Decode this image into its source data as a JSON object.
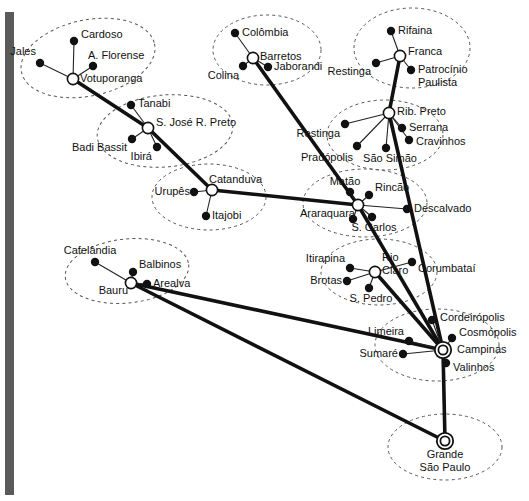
{
  "diagram": {
    "type": "hub-and-spoke network map",
    "colors": {
      "trunk": "#111111",
      "spoke": "#222222",
      "node_fill": "#ffffff",
      "terminal_fill": "#111111",
      "ellipse": "#555555",
      "label": "#111111",
      "scan_artifact": "#5a5a5a"
    },
    "scan_artifact": {
      "x": 5,
      "y": 12,
      "width": 9,
      "height": 483
    },
    "clusters": [
      {
        "name": "votuporanga-cluster",
        "cx": 88,
        "cy": 58,
        "rx": 68,
        "ry": 38,
        "rot": -12
      },
      {
        "name": "barretos-cluster",
        "cx": 267,
        "cy": 50,
        "rx": 54,
        "ry": 35,
        "rot": 0
      },
      {
        "name": "franca-cluster",
        "cx": 412,
        "cy": 48,
        "rx": 58,
        "ry": 40,
        "rot": 0
      },
      {
        "name": "sjrpreto-cluster",
        "cx": 165,
        "cy": 131,
        "rx": 68,
        "ry": 36,
        "rot": -5
      },
      {
        "name": "ribpreto-cluster",
        "cx": 385,
        "cy": 135,
        "rx": 58,
        "ry": 35,
        "rot": 0
      },
      {
        "name": "catanduva-cluster",
        "cx": 209,
        "cy": 197,
        "rx": 57,
        "ry": 33,
        "rot": 0
      },
      {
        "name": "araraquara-cluster",
        "cx": 365,
        "cy": 203,
        "rx": 62,
        "ry": 34,
        "rot": 0
      },
      {
        "name": "rioclaro-cluster",
        "cx": 379,
        "cy": 272,
        "rx": 58,
        "ry": 33,
        "rot": 0
      },
      {
        "name": "bauru-cluster",
        "cx": 127,
        "cy": 271,
        "rx": 62,
        "ry": 32,
        "rot": -6
      },
      {
        "name": "campinas-cluster",
        "cx": 437,
        "cy": 345,
        "rx": 62,
        "ry": 36,
        "rot": 0
      },
      {
        "name": "saopaulo-cluster",
        "cx": 445,
        "cy": 447,
        "rx": 57,
        "ry": 33,
        "rot": 0
      }
    ],
    "hubs": [
      {
        "id": "votuporanga",
        "label": "Votuporanga",
        "x": 73,
        "y": 79,
        "lx": 80,
        "ly": 79,
        "type": "hub",
        "anchor": "start"
      },
      {
        "id": "barretos",
        "label": "Barretos",
        "x": 253,
        "y": 58,
        "lx": 260,
        "ly": 57,
        "type": "hub",
        "anchor": "start"
      },
      {
        "id": "franca",
        "label": "Franca",
        "x": 400,
        "y": 56,
        "lx": 408,
        "ly": 52,
        "type": "hub",
        "anchor": "start"
      },
      {
        "id": "sjrpreto",
        "label": "S. José R. Preto",
        "x": 148,
        "y": 128,
        "lx": 156,
        "ly": 123,
        "type": "hub",
        "anchor": "start"
      },
      {
        "id": "ribpreto",
        "label": "Rib. Preto",
        "x": 389,
        "y": 113,
        "lx": 397,
        "ly": 112,
        "type": "hub",
        "anchor": "start"
      },
      {
        "id": "catanduva",
        "label": "Catanduva",
        "x": 212,
        "y": 190,
        "lx": 209,
        "ly": 180,
        "type": "hub",
        "anchor": "start"
      },
      {
        "id": "araraquara",
        "label": "Araraquara",
        "x": 358,
        "y": 205,
        "lx": 355,
        "ly": 214,
        "type": "hub",
        "anchor": "end"
      },
      {
        "id": "rioclaro",
        "label": "Rio\nClaro",
        "x": 375,
        "y": 272,
        "lx": 382,
        "ly": 258,
        "type": "hub",
        "anchor": "start"
      },
      {
        "id": "bauru",
        "label": "Bauru",
        "x": 131,
        "y": 283,
        "lx": 128,
        "ly": 291,
        "type": "hub",
        "anchor": "end"
      },
      {
        "id": "campinas",
        "label": "Campinas",
        "x": 443,
        "y": 350,
        "lx": 457,
        "ly": 350,
        "type": "gateway",
        "anchor": "start"
      },
      {
        "id": "saopaulo",
        "label": "Grande\nSão Paulo",
        "x": 445,
        "y": 441,
        "lx": 445,
        "ly": 455,
        "type": "gateway",
        "anchor": "middle"
      }
    ],
    "terminals": [
      {
        "id": "cardoso",
        "label": "Cardoso",
        "x": 74,
        "y": 41,
        "lx": 81,
        "ly": 35,
        "hub": "votuporanga",
        "anchor": "start"
      },
      {
        "id": "jales",
        "label": "Jales",
        "x": 40,
        "y": 63,
        "lx": 36,
        "ly": 52,
        "hub": "votuporanga",
        "anchor": "end"
      },
      {
        "id": "aflorense",
        "label": "A. Florense",
        "x": 93,
        "y": 66,
        "lx": 88,
        "ly": 56,
        "hub": "votuporanga",
        "anchor": "start"
      },
      {
        "id": "colombia",
        "label": "Colômbia",
        "x": 235,
        "y": 33,
        "lx": 242,
        "ly": 33,
        "hub": "barretos",
        "anchor": "start"
      },
      {
        "id": "colina",
        "label": "Colina",
        "x": 243,
        "y": 66,
        "lx": 239,
        "ly": 76,
        "hub": "barretos",
        "anchor": "end"
      },
      {
        "id": "jaborandi",
        "label": "Jaborandi",
        "x": 268,
        "y": 67,
        "lx": 274,
        "ly": 67,
        "hub": "barretos",
        "anchor": "start"
      },
      {
        "id": "rifaina",
        "label": "Rifaina",
        "x": 391,
        "y": 31,
        "lx": 398,
        "ly": 31,
        "hub": "franca",
        "anchor": "start"
      },
      {
        "id": "restinga-f",
        "label": "Restinga",
        "x": 376,
        "y": 63,
        "lx": 371,
        "ly": 72,
        "hub": "franca",
        "anchor": "end"
      },
      {
        "id": "patrocinio",
        "label": "Patrocínio\nPaulista",
        "x": 411,
        "y": 70,
        "lx": 418,
        "ly": 70,
        "hub": "franca",
        "anchor": "start"
      },
      {
        "id": "tanabi",
        "label": "Tanabi",
        "x": 131,
        "y": 105,
        "lx": 138,
        "ly": 104,
        "hub": "sjrpreto",
        "anchor": "start"
      },
      {
        "id": "badibassit",
        "label": "Badi Bassit",
        "x": 132,
        "y": 139,
        "lx": 127,
        "ly": 148,
        "hub": "sjrpreto",
        "anchor": "end"
      },
      {
        "id": "ibira",
        "label": "Ibirá",
        "x": 157,
        "y": 147,
        "lx": 152,
        "ly": 157,
        "hub": "sjrpreto",
        "anchor": "end"
      },
      {
        "id": "restinga-r",
        "label": "Restinga",
        "x": 345,
        "y": 124,
        "lx": 340,
        "ly": 134,
        "hub": "ribpreto",
        "anchor": "end"
      },
      {
        "id": "serrana",
        "label": "Serrana",
        "x": 402,
        "y": 128,
        "lx": 409,
        "ly": 128,
        "hub": "ribpreto",
        "anchor": "start"
      },
      {
        "id": "cravinhos",
        "label": "Cravinhos",
        "x": 409,
        "y": 140,
        "lx": 416,
        "ly": 142,
        "hub": "ribpreto",
        "anchor": "start"
      },
      {
        "id": "pradopolis",
        "label": "Pradópolis",
        "x": 357,
        "y": 146,
        "lx": 353,
        "ly": 158,
        "hub": "ribpreto",
        "anchor": "end"
      },
      {
        "id": "saosimao",
        "label": "São Simão",
        "x": 386,
        "y": 148,
        "lx": 390,
        "ly": 159,
        "hub": "ribpreto",
        "anchor": "middle"
      },
      {
        "id": "urupes",
        "label": "Urupês",
        "x": 194,
        "y": 192,
        "lx": 190,
        "ly": 192,
        "hub": "catanduva",
        "anchor": "end"
      },
      {
        "id": "itajobi",
        "label": "Itajobi",
        "x": 206,
        "y": 216,
        "lx": 212,
        "ly": 216,
        "hub": "catanduva",
        "anchor": "start"
      },
      {
        "id": "matao",
        "label": "Matão",
        "x": 350,
        "y": 192,
        "lx": 345,
        "ly": 182,
        "hub": "araraquara",
        "anchor": "middle"
      },
      {
        "id": "rincao",
        "label": "Rincão",
        "x": 369,
        "y": 195,
        "lx": 375,
        "ly": 188,
        "hub": "araraquara",
        "anchor": "start"
      },
      {
        "id": "descalvado",
        "label": "Descalvado",
        "x": 407,
        "y": 209,
        "lx": 414,
        "ly": 209,
        "hub": "araraquara",
        "anchor": "start"
      },
      {
        "id": "saocarlos",
        "label": "S. Carlos",
        "x": 372,
        "y": 217,
        "lx": 374,
        "ly": 228,
        "hub": "araraquara",
        "anchor": "middle"
      },
      {
        "id": "araq-spoke",
        "label": "",
        "x": 353,
        "y": 219,
        "lx": 353,
        "ly": 219,
        "hub": "araraquara",
        "anchor": "middle"
      },
      {
        "id": "itirapina",
        "label": "Itirapina",
        "x": 350,
        "y": 268,
        "lx": 345,
        "ly": 259,
        "hub": "rioclaro",
        "anchor": "end"
      },
      {
        "id": "brotas",
        "label": "Brotas",
        "x": 347,
        "y": 281,
        "lx": 342,
        "ly": 281,
        "hub": "rioclaro",
        "anchor": "end"
      },
      {
        "id": "spedro",
        "label": "S. Pedro",
        "x": 369,
        "y": 288,
        "lx": 371,
        "ly": 299,
        "hub": "rioclaro",
        "anchor": "middle"
      },
      {
        "id": "corumbatai",
        "label": "Corumbataí",
        "x": 412,
        "y": 262,
        "lx": 418,
        "ly": 269,
        "hub": "rioclaro",
        "anchor": "start"
      },
      {
        "id": "cafelandia",
        "label": "Cafelândia",
        "x": 95,
        "y": 262,
        "lx": 90,
        "ly": 251,
        "hub": "bauru",
        "anchor": "middle"
      },
      {
        "id": "balbinos",
        "label": "Balbinos",
        "x": 133,
        "y": 272,
        "lx": 139,
        "ly": 265,
        "hub": "bauru",
        "anchor": "start"
      },
      {
        "id": "arealva",
        "label": "Arealva",
        "x": 147,
        "y": 284,
        "lx": 153,
        "ly": 284,
        "hub": "bauru",
        "anchor": "start"
      },
      {
        "id": "cordeiropolis",
        "label": "Cordeirópolis",
        "x": 432,
        "y": 320,
        "lx": 440,
        "ly": 318,
        "hub": "campinas",
        "anchor": "start"
      },
      {
        "id": "cosmopolis",
        "label": "Cosmópolis",
        "x": 452,
        "y": 338,
        "lx": 459,
        "ly": 333,
        "hub": "campinas",
        "anchor": "start"
      },
      {
        "id": "limeira",
        "label": "Limeira",
        "x": 409,
        "y": 341,
        "lx": 404,
        "ly": 332,
        "hub": "campinas",
        "anchor": "end"
      },
      {
        "id": "sumare",
        "label": "Sumaré",
        "x": 403,
        "y": 354,
        "lx": 398,
        "ly": 354,
        "hub": "campinas",
        "anchor": "end"
      },
      {
        "id": "valinhos",
        "label": "Valinhos",
        "x": 446,
        "y": 363,
        "lx": 453,
        "ly": 368,
        "hub": "campinas",
        "anchor": "start"
      }
    ],
    "trunk_links": [
      {
        "from": "votuporanga",
        "to": "sjrpreto"
      },
      {
        "from": "sjrpreto",
        "to": "catanduva"
      },
      {
        "from": "catanduva",
        "to": "araraquara"
      },
      {
        "from": "barretos",
        "to": "araraquara"
      },
      {
        "from": "franca",
        "to": "ribpreto"
      },
      {
        "from": "ribpreto",
        "to": "campinas"
      },
      {
        "from": "araraquara",
        "to": "campinas"
      },
      {
        "from": "rioclaro",
        "to": "campinas"
      },
      {
        "from": "bauru",
        "to": "campinas"
      },
      {
        "from": "bauru",
        "to": "saopaulo"
      },
      {
        "from": "campinas",
        "to": "saopaulo"
      }
    ]
  }
}
